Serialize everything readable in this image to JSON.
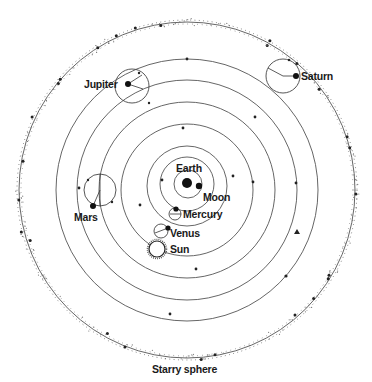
{
  "diagram": {
    "center": {
      "x": 187,
      "y": 190
    },
    "colors": {
      "line": "#555555",
      "body": "#111111",
      "text": "#1a1a1a",
      "background": "#ffffff"
    },
    "starry_sphere": {
      "label": "Starry sphere",
      "radius": 168,
      "label_x": 184,
      "label_y": 372
    },
    "earth": {
      "label": "Earth",
      "x": 187,
      "y": 183,
      "r": 5,
      "label_x": 176,
      "label_y": 170
    },
    "moon": {
      "label": "Moon",
      "x": 199,
      "y": 186,
      "r": 3.2,
      "orbit_r": 14,
      "label_x": 203,
      "label_y": 201
    },
    "bodies": [
      {
        "name": "Mercury",
        "deferent_r": 27,
        "epicycle": {
          "cx": 175,
          "cy": 214,
          "r": 6
        },
        "planet": {
          "x": 176,
          "y": 210
        },
        "label": {
          "x": 183,
          "y": 218
        }
      },
      {
        "name": "Venus",
        "deferent_r": 38,
        "epicycle": {
          "cx": 161,
          "cy": 231,
          "r": 7
        },
        "planet": {
          "x": 168,
          "y": 228
        },
        "label": {
          "x": 170,
          "y": 236
        }
      },
      {
        "name": "Sun",
        "deferent_r": 60,
        "planet": {
          "x": 157,
          "y": 249
        },
        "label": {
          "x": 171,
          "y": 253
        }
      },
      {
        "name": "Mars",
        "deferent_r": 88,
        "epicycle": {
          "cx": 100,
          "cy": 190,
          "r": 16
        },
        "planet": {
          "x": 93,
          "y": 206
        },
        "label": {
          "x": 74,
          "y": 221
        }
      },
      {
        "name": "Jupiter",
        "deferent_r": 110,
        "epicycle": {
          "cx": 132,
          "cy": 86,
          "r": 17
        },
        "planet": {
          "x": 128,
          "y": 84
        },
        "label": {
          "x": 84,
          "y": 88
        }
      },
      {
        "name": "Saturn",
        "deferent_r": 131,
        "epicycle": {
          "cx": 283,
          "cy": 76,
          "r": 17
        },
        "planet": {
          "x": 296,
          "y": 76
        },
        "label": {
          "x": 301,
          "y": 80
        }
      }
    ],
    "labels": {
      "earth": "Earth",
      "moon": "Moon",
      "mercury": "Mercury",
      "venus": "Venus",
      "sun": "Sun",
      "mars": "Mars",
      "jupiter": "Jupiter",
      "saturn": "Saturn",
      "starry_sphere": "Starry sphere"
    }
  }
}
